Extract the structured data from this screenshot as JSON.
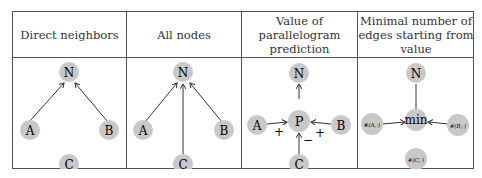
{
  "table": {
    "headers": [
      "Direct neighbors",
      "All nodes",
      "Value of parallelogram prediction",
      "Minimal number of edges starting from value"
    ],
    "header_lines": [
      [
        "Direct neighbors"
      ],
      [
        "All nodes"
      ],
      [
        "Value of",
        "parallelogram",
        "prediction"
      ],
      [
        "Minimal number of",
        "edges starting from",
        "value"
      ]
    ],
    "columns": [
      {
        "nodes": {
          "N": "N",
          "A": "A",
          "B": "B",
          "C": "C"
        },
        "edges": [
          [
            "A",
            "N"
          ],
          [
            "B",
            "N"
          ]
        ]
      },
      {
        "nodes": {
          "N": "N",
          "A": "A",
          "B": "B",
          "C": "C"
        },
        "edges": [
          [
            "A",
            "N"
          ],
          [
            "C",
            "N"
          ],
          [
            "B",
            "N"
          ]
        ]
      },
      {
        "nodes": {
          "N": "N",
          "P": "P",
          "A": "A",
          "B": "B",
          "C": "C"
        },
        "edges": [
          [
            "P",
            "N"
          ],
          [
            "A",
            "P"
          ],
          [
            "B",
            "P"
          ],
          [
            "C",
            "P"
          ]
        ],
        "edge_signs": {
          "A": "+",
          "B": "+",
          "C": "−"
        }
      },
      {
        "nodes": {
          "N": "N",
          "min": "min",
          "A": "#(A,·)",
          "B": "#(B,·)",
          "C": "#(C,·)"
        },
        "edges": [
          [
            "min",
            "N"
          ],
          [
            "A",
            "min"
          ],
          [
            "B",
            "min"
          ]
        ]
      }
    ]
  },
  "colors": {
    "node_fill": "#c8c8c8",
    "line": "#333333",
    "border": "#555555"
  }
}
